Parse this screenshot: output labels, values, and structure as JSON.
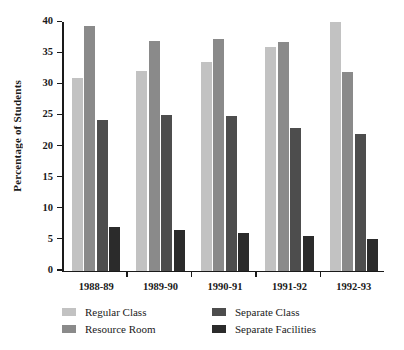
{
  "chart_data": {
    "type": "bar",
    "title": "",
    "xlabel": "",
    "ylabel": "Percentage of Students",
    "ylim": [
      0,
      40
    ],
    "yticks": [
      0,
      5,
      10,
      15,
      20,
      25,
      30,
      35,
      40
    ],
    "grid": false,
    "legend_position": "bottom",
    "categories": [
      "1988-89",
      "1989-90",
      "1990-91",
      "1991-92",
      "1992-93"
    ],
    "series": [
      {
        "name": "Regular Class",
        "color": "#c2c2c2",
        "values": [
          31.0,
          32.1,
          33.5,
          36.0,
          40.0
        ]
      },
      {
        "name": "Resource Room",
        "color": "#8a8a8a",
        "values": [
          39.3,
          37.0,
          37.3,
          36.8,
          32.0
        ]
      },
      {
        "name": "Separate Class",
        "color": "#4d4d4d",
        "values": [
          24.2,
          25.0,
          24.8,
          23.0,
          22.0
        ]
      },
      {
        "name": "Separate Facilities",
        "color": "#2b2b2b",
        "values": [
          7.0,
          6.5,
          6.0,
          5.5,
          5.0
        ]
      }
    ]
  }
}
